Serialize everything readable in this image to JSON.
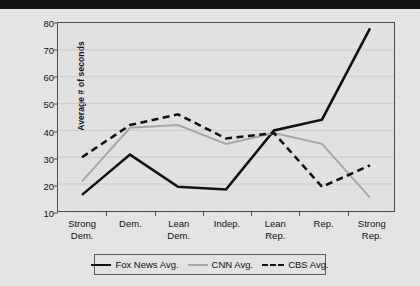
{
  "figure": {
    "y_axis_title": "Average # of seconds"
  },
  "legend": {
    "entries": [
      {
        "label": "Fox News Avg.",
        "style": "solid-black",
        "color": "#111111"
      },
      {
        "label": "CNN Avg.",
        "style": "solid-gray",
        "color": "#a9a9a9"
      },
      {
        "label": "CBS Avg.",
        "style": "dashed-black",
        "color": "#111111"
      }
    ]
  },
  "chart_data": {
    "type": "line",
    "title": "",
    "xlabel": "",
    "ylabel": "Average # of seconds",
    "ylim": [
      10,
      80
    ],
    "ytick_labels": [
      "10",
      "20",
      "30",
      "40",
      "50",
      "60",
      "70",
      "80"
    ],
    "yticks": [
      10,
      20,
      30,
      40,
      50,
      60,
      70,
      80
    ],
    "grid": true,
    "legend_position": "bottom",
    "categories": [
      "Strong Dem.",
      "Dem.",
      "Lean Dem.",
      "Indep.",
      "Lean Rep.",
      "Rep.",
      "Strong Rep."
    ],
    "category_lines": [
      [
        "Strong",
        "Dem."
      ],
      [
        "Dem.",
        ""
      ],
      [
        "Lean",
        "Dem."
      ],
      [
        "Indep.",
        ""
      ],
      [
        "Lean",
        "Rep."
      ],
      [
        "Rep.",
        ""
      ],
      [
        "Strong",
        "Rep."
      ]
    ],
    "series": [
      {
        "name": "Fox News Avg.",
        "color": "#111111",
        "style": "solid",
        "width": 2.6,
        "values": [
          16,
          31,
          19,
          18,
          40,
          44,
          78
        ]
      },
      {
        "name": "CNN Avg.",
        "color": "#a9a9a9",
        "style": "solid",
        "width": 2.0,
        "values": [
          21,
          41,
          42,
          35,
          39,
          35,
          15
        ]
      },
      {
        "name": "CBS Avg.",
        "color": "#111111",
        "style": "dashed",
        "width": 2.6,
        "values": [
          30,
          42,
          46,
          37,
          39,
          19,
          27
        ]
      }
    ]
  }
}
